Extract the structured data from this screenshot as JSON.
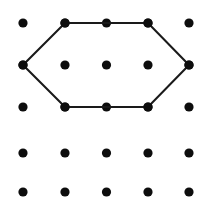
{
  "figure": {
    "background_color": "#ffffff",
    "width": 207,
    "height": 211
  },
  "lattice": {
    "name": "dot-grid",
    "rows": 5,
    "columns": 5,
    "dot_color": "#0d0d0d",
    "dot_radius": 4.6,
    "column_x": [
      23,
      65,
      106.5,
      148,
      189
    ],
    "row_y": [
      23,
      65,
      107,
      153,
      192
    ],
    "points": [
      {
        "col": 1,
        "row": 1,
        "x": 23,
        "y": 23
      },
      {
        "col": 2,
        "row": 1,
        "x": 65,
        "y": 23
      },
      {
        "col": 3,
        "row": 1,
        "x": 106.5,
        "y": 23
      },
      {
        "col": 4,
        "row": 1,
        "x": 148,
        "y": 23
      },
      {
        "col": 5,
        "row": 1,
        "x": 189,
        "y": 23
      },
      {
        "col": 1,
        "row": 2,
        "x": 23,
        "y": 65
      },
      {
        "col": 2,
        "row": 2,
        "x": 65,
        "y": 65
      },
      {
        "col": 3,
        "row": 2,
        "x": 106.5,
        "y": 65
      },
      {
        "col": 4,
        "row": 2,
        "x": 148,
        "y": 65
      },
      {
        "col": 5,
        "row": 2,
        "x": 189,
        "y": 65
      },
      {
        "col": 1,
        "row": 3,
        "x": 23,
        "y": 107
      },
      {
        "col": 2,
        "row": 3,
        "x": 65,
        "y": 107
      },
      {
        "col": 3,
        "row": 3,
        "x": 106.5,
        "y": 107
      },
      {
        "col": 4,
        "row": 3,
        "x": 148,
        "y": 107
      },
      {
        "col": 5,
        "row": 3,
        "x": 189,
        "y": 107
      },
      {
        "col": 1,
        "row": 4,
        "x": 23,
        "y": 153
      },
      {
        "col": 2,
        "row": 4,
        "x": 65,
        "y": 153
      },
      {
        "col": 3,
        "row": 4,
        "x": 106.5,
        "y": 153
      },
      {
        "col": 4,
        "row": 4,
        "x": 148,
        "y": 153
      },
      {
        "col": 5,
        "row": 4,
        "x": 189,
        "y": 153
      },
      {
        "col": 1,
        "row": 5,
        "x": 23,
        "y": 192
      },
      {
        "col": 2,
        "row": 5,
        "x": 65,
        "y": 192
      },
      {
        "col": 3,
        "row": 5,
        "x": 106.5,
        "y": 192
      },
      {
        "col": 4,
        "row": 5,
        "x": 148,
        "y": 192
      },
      {
        "col": 5,
        "row": 5,
        "x": 189,
        "y": 192
      }
    ]
  },
  "shape": {
    "name": "hexagon",
    "sides": 6,
    "stroke_color": "#1a1a1a",
    "stroke_width": 2.1,
    "fill": "none",
    "closed": true,
    "vertices": [
      {
        "label": "top-left",
        "col": 2,
        "row": 1,
        "x": 65,
        "y": 23
      },
      {
        "label": "top-right",
        "col": 4,
        "row": 1,
        "x": 148,
        "y": 23
      },
      {
        "label": "right",
        "col": 5,
        "row": 2,
        "x": 189,
        "y": 65
      },
      {
        "label": "bottom-right",
        "col": 4,
        "row": 3,
        "x": 148,
        "y": 107
      },
      {
        "label": "bottom-left",
        "col": 2,
        "row": 3,
        "x": 65,
        "y": 107
      },
      {
        "label": "left",
        "col": 1,
        "row": 2,
        "x": 23,
        "y": 65
      }
    ],
    "path": "M 65 23 L 148 23 L 189 65 L 148 107 L 65 107 L 23 65 Z"
  }
}
